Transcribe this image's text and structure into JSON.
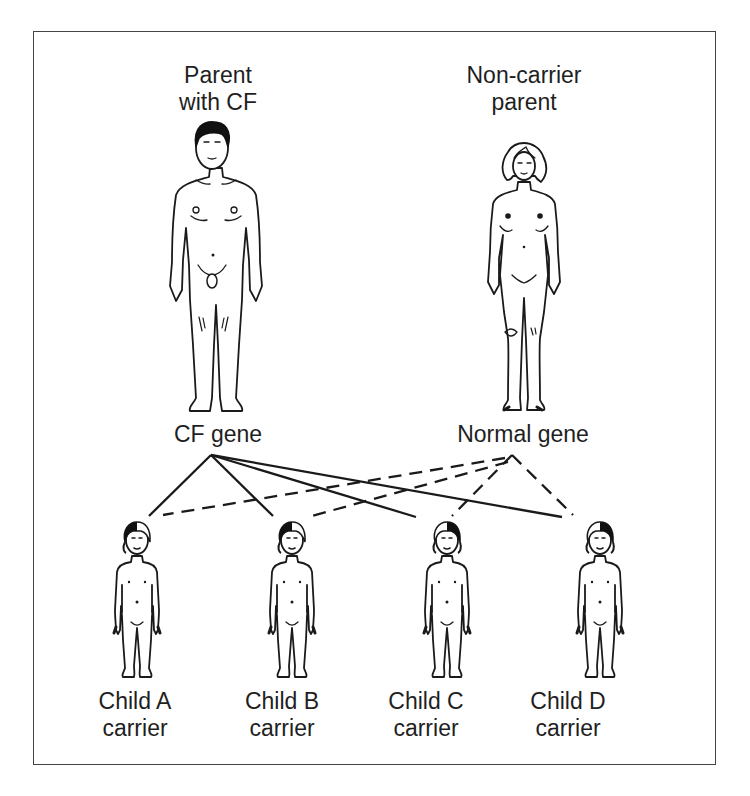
{
  "diagram": {
    "type": "inheritance-pedigree",
    "parents": [
      {
        "id": "father",
        "label_line1": "Parent",
        "label_line2": "with CF",
        "gene_label": "CF gene",
        "hair": "dark",
        "line_style": "solid"
      },
      {
        "id": "mother",
        "label_line1": "Non-carrier",
        "label_line2": "parent",
        "gene_label": "Normal gene",
        "hair": "light",
        "line_style": "dashed"
      }
    ],
    "children": [
      {
        "id": "A",
        "name": "Child A",
        "status": "carrier",
        "hair_split": "dark-left"
      },
      {
        "id": "B",
        "name": "Child B",
        "status": "carrier",
        "hair_split": "dark-left"
      },
      {
        "id": "C",
        "name": "Child C",
        "status": "carrier",
        "hair_split": "dark-right"
      },
      {
        "id": "D",
        "name": "Child D",
        "status": "carrier",
        "hair_split": "dark-right"
      }
    ],
    "connections": [
      {
        "from": "CF gene",
        "to": "Child A",
        "style": "solid"
      },
      {
        "from": "CF gene",
        "to": "Child B",
        "style": "solid"
      },
      {
        "from": "CF gene",
        "to": "Child C",
        "style": "solid"
      },
      {
        "from": "CF gene",
        "to": "Child D",
        "style": "solid"
      },
      {
        "from": "Normal gene",
        "to": "Child A",
        "style": "dashed"
      },
      {
        "from": "Normal gene",
        "to": "Child B",
        "style": "dashed"
      },
      {
        "from": "Normal gene",
        "to": "Child C",
        "style": "dashed"
      },
      {
        "from": "Normal gene",
        "to": "Child D",
        "style": "dashed"
      }
    ],
    "colors": {
      "line": "#1a1a1a",
      "border": "#444444",
      "hair_dark": "#111111",
      "background": "#ffffff"
    }
  }
}
